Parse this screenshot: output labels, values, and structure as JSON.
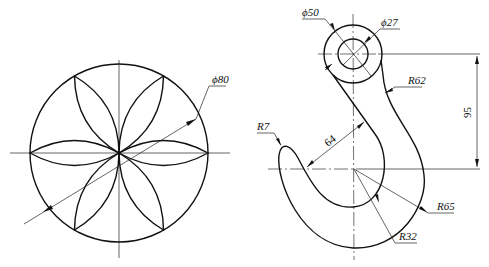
{
  "drawings": [
    {
      "name": "rosette",
      "dimensions": [
        {
          "type": "diameter",
          "label": "ϕ80"
        }
      ]
    },
    {
      "name": "hook",
      "dimensions": [
        {
          "type": "diameter",
          "label": "ϕ50"
        },
        {
          "type": "diameter",
          "label": "ϕ27"
        },
        {
          "type": "radius",
          "label": "R62"
        },
        {
          "type": "linear",
          "label": "95"
        },
        {
          "type": "radius",
          "label": "R7"
        },
        {
          "type": "linear",
          "label": "64"
        },
        {
          "type": "radius",
          "label": "R65"
        },
        {
          "type": "radius",
          "label": "R32"
        }
      ]
    }
  ],
  "labels": {
    "phi80": "ϕ80",
    "phi50": "ϕ50",
    "phi27": "ϕ27",
    "r62": "R62",
    "d95": "95",
    "r7": "R7",
    "d64": "64",
    "r65": "R65",
    "r32": "R32"
  }
}
